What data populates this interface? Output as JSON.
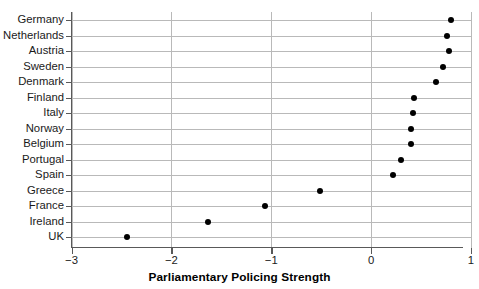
{
  "chart_data": {
    "type": "scatter",
    "title": "",
    "xlabel": "Parliamentary Policing Strength",
    "ylabel": "",
    "orientation": "horizontal-dot-plot",
    "xlim": [
      -3,
      1
    ],
    "xticks": [
      -3,
      -2,
      -1,
      0,
      1
    ],
    "xtick_labels": [
      "−3",
      "−2",
      "−1",
      "0",
      "1"
    ],
    "grid": "both",
    "legend": "none",
    "marker": "filled-circle",
    "marker_color": "#000000",
    "categories": [
      "Germany",
      "Netherlands",
      "Austria",
      "Sweden",
      "Denmark",
      "Finland",
      "Italy",
      "Norway",
      "Belgium",
      "Portugal",
      "Spain",
      "Greece",
      "France",
      "Ireland",
      "UK"
    ],
    "values": [
      0.8,
      0.76,
      0.78,
      0.72,
      0.65,
      0.43,
      0.42,
      0.4,
      0.4,
      0.3,
      0.22,
      -0.51,
      -1.06,
      -1.63,
      -2.44
    ]
  }
}
